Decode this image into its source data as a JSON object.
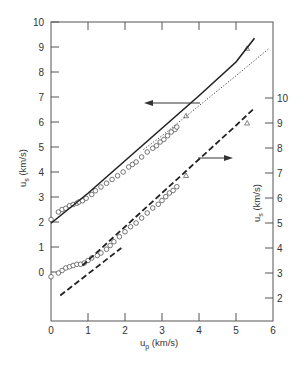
{
  "chart_data": {
    "type": "scatter",
    "title": "",
    "xlabel": "u_p (km/s)",
    "ylabel_left": "u_s (km/s)",
    "ylabel_right": "u_s (km/s)",
    "xlim": [
      0,
      6
    ],
    "ylim_left": [
      -2,
      10
    ],
    "ylim_right": [
      1,
      11
    ],
    "x_ticks": [
      0,
      1,
      2,
      3,
      4,
      5,
      6
    ],
    "y_ticks_left": [
      0,
      1,
      2,
      3,
      4,
      5,
      6,
      7,
      8,
      9,
      10
    ],
    "y_ticks_right": [
      2,
      3,
      4,
      5,
      6,
      7,
      8,
      9,
      10
    ],
    "grid": false,
    "legend": null,
    "annotations": [
      {
        "type": "arrow",
        "direction": "left",
        "meaning": "upper dataset uses left axis"
      },
      {
        "type": "arrow",
        "direction": "right",
        "meaning": "lower dataset uses right axis"
      }
    ],
    "series": [
      {
        "name": "upper data (circles)",
        "axis": "left",
        "marker": "circle",
        "x": [
          0.0,
          0.2,
          0.3,
          0.4,
          0.5,
          0.6,
          0.7,
          0.75,
          0.85,
          0.95,
          1.1,
          1.2,
          1.35,
          1.5,
          1.65,
          1.8,
          1.95,
          2.1,
          2.2,
          2.3,
          2.45,
          2.6,
          2.75,
          2.85,
          2.95,
          3.05,
          3.15,
          3.25,
          3.35,
          3.4
        ],
        "y": [
          2.1,
          2.4,
          2.5,
          2.55,
          2.65,
          2.7,
          2.75,
          2.8,
          2.85,
          2.95,
          3.1,
          3.25,
          3.4,
          3.55,
          3.7,
          3.85,
          4.0,
          4.2,
          4.3,
          4.4,
          4.6,
          4.8,
          4.95,
          5.05,
          5.2,
          5.3,
          5.45,
          5.6,
          5.7,
          5.8
        ]
      },
      {
        "name": "upper data (triangles)",
        "axis": "left",
        "marker": "triangle",
        "x": [
          3.65,
          5.3
        ],
        "y": [
          6.25,
          8.95
        ]
      },
      {
        "name": "upper fit (solid)",
        "axis": "left",
        "style": "solid",
        "x": [
          0,
          1,
          2,
          3,
          4,
          5,
          5.5
        ],
        "y": [
          1.95,
          3.15,
          4.45,
          5.75,
          7.05,
          8.4,
          9.35
        ]
      },
      {
        "name": "upper fit (dotted)",
        "axis": "left",
        "style": "dotted",
        "x": [
          2.5,
          3,
          4,
          5,
          5.9
        ],
        "y": [
          4.9,
          5.45,
          6.65,
          7.85,
          8.95
        ]
      },
      {
        "name": "lower data (circles)",
        "axis": "right",
        "marker": "circle",
        "x": [
          0.0,
          0.2,
          0.3,
          0.4,
          0.5,
          0.6,
          0.7,
          0.8,
          0.9,
          1.0,
          1.1,
          1.25,
          1.35,
          1.5,
          1.6,
          1.7,
          1.85,
          2.0,
          2.15,
          2.3,
          2.45,
          2.6,
          2.75,
          2.9,
          3.0,
          3.1,
          3.2,
          3.3,
          3.4
        ],
        "y": [
          2.85,
          3.0,
          3.1,
          3.2,
          3.25,
          3.3,
          3.35,
          3.35,
          3.4,
          3.5,
          3.6,
          3.7,
          3.8,
          3.95,
          4.1,
          4.25,
          4.45,
          4.65,
          4.85,
          5.0,
          5.2,
          5.4,
          5.6,
          5.75,
          5.9,
          6.05,
          6.2,
          6.3,
          6.45
        ]
      },
      {
        "name": "lower data (triangles)",
        "axis": "right",
        "marker": "triangle",
        "x": [
          3.65,
          5.3
        ],
        "y": [
          6.9,
          9.0
        ]
      },
      {
        "name": "lower fit (long dash)",
        "axis": "right",
        "style": "dashed",
        "x": [
          0.85,
          2,
          3,
          4,
          5,
          5.5
        ],
        "y": [
          3.3,
          4.85,
          6.2,
          7.55,
          8.9,
          9.6
        ]
      },
      {
        "name": "lower fit low-u_p segment (dashed)",
        "axis": "right",
        "style": "dashed",
        "x": [
          0.25,
          1.9
        ],
        "y": [
          2.1,
          4.0
        ]
      }
    ]
  },
  "labels": {
    "x_axis": "u",
    "x_axis_sub": "p",
    "x_axis_unit": " (km/s)",
    "y_left": "u",
    "y_left_sub": "s",
    "y_left_unit": " (km/s)",
    "y_right": "u",
    "y_right_sub": "s",
    "y_right_unit": " (km/s)"
  }
}
